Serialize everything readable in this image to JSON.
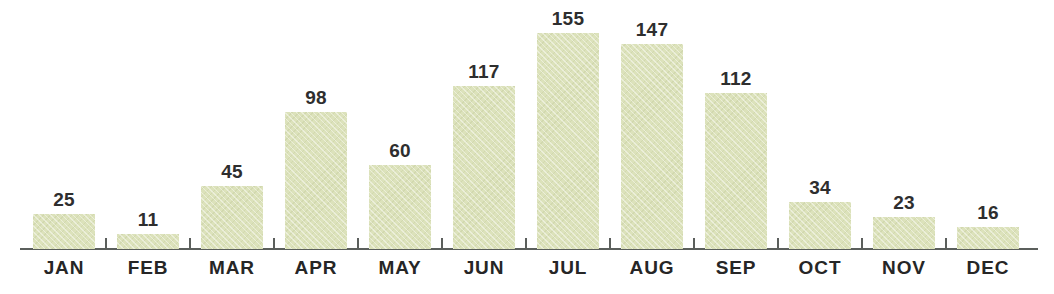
{
  "chart_data": {
    "type": "bar",
    "title": "",
    "subtitle": "",
    "xlabel": "",
    "ylabel": "",
    "categories": [
      "JAN",
      "FEB",
      "MAR",
      "APR",
      "MAY",
      "JUN",
      "JUL",
      "AUG",
      "SEP",
      "OCT",
      "NOV",
      "DEC"
    ],
    "values": [
      25,
      11,
      45,
      98,
      60,
      117,
      155,
      147,
      112,
      34,
      23,
      16
    ],
    "value_labels": [
      "25",
      "11",
      "45",
      "98",
      "60",
      "117",
      "155",
      "147",
      "112",
      "34",
      "23",
      "16"
    ],
    "ylim": [
      0,
      155
    ],
    "grid": false,
    "legend": null,
    "legend_position": "none",
    "axis": {
      "x_axis_visible": true,
      "y_axis_visible": false,
      "tick_labels_y": [],
      "data_labels_shown": true
    }
  },
  "style": {
    "bar_color": "#dce2bb",
    "bar_texture": "diagonal-weave",
    "axis_color": "#5b5f5c",
    "value_label_color": "#2e2e2e",
    "category_label_color": "#262626",
    "background_color": "#ffffff"
  }
}
